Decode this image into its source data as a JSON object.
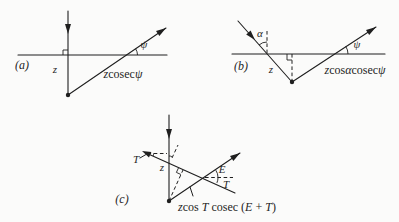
{
  "colors": {
    "ink": "#1f1f1f",
    "paper": "#fbfbfa"
  },
  "figure": {
    "panels": [
      {
        "tag": "(a)",
        "depth_label": "z",
        "angles": {
          "psi": "ψ"
        },
        "path_label": [
          {
            "t": "z",
            "i": 1
          },
          {
            "t": "cosec",
            "i": 0
          },
          {
            "t": "ψ",
            "i": 1
          }
        ]
      },
      {
        "tag": "(b)",
        "depth_label": "z",
        "angles": {
          "alpha": "α",
          "psi": "ψ"
        },
        "path_label": [
          {
            "t": "z",
            "i": 1
          },
          {
            "t": "cos",
            "i": 0
          },
          {
            "t": "α",
            "i": 1
          },
          {
            "t": "cosec",
            "i": 0
          },
          {
            "t": "ψ",
            "i": 1
          }
        ]
      },
      {
        "tag": "(c)",
        "depth_label": "z",
        "angles": {
          "dip_T": "T",
          "emergence_E": "E",
          "dip_T_right": "T"
        },
        "path_label": [
          {
            "t": "z",
            "i": 1
          },
          {
            "t": "cos ",
            "i": 0
          },
          {
            "t": "T",
            "i": 1
          },
          {
            "t": " cosec ",
            "i": 0
          },
          {
            "t": "(",
            "i": 0
          },
          {
            "t": "E",
            "i": 1
          },
          {
            "t": " + ",
            "i": 0
          },
          {
            "t": "T",
            "i": 1
          },
          {
            "t": ")",
            "i": 0
          }
        ]
      }
    ]
  }
}
